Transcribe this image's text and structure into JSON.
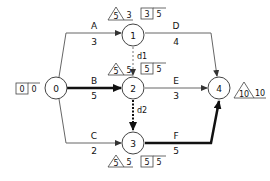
{
  "nodes": [
    {
      "id": "0",
      "label": "0"
    },
    {
      "id": "1",
      "label": "1"
    },
    {
      "id": "2",
      "label": "2"
    },
    {
      "id": "3",
      "label": "3"
    },
    {
      "id": "4",
      "label": "4"
    }
  ],
  "activities": [
    {
      "name": "A",
      "duration": "3",
      "from": "0",
      "to": "1",
      "critical": false
    },
    {
      "name": "B",
      "duration": "5",
      "from": "0",
      "to": "2",
      "critical": true
    },
    {
      "name": "C",
      "duration": "2",
      "from": "0",
      "to": "3",
      "critical": false
    },
    {
      "name": "D",
      "duration": "4",
      "from": "1",
      "to": "4",
      "critical": false
    },
    {
      "name": "E",
      "duration": "3",
      "from": "2",
      "to": "4",
      "critical": false
    },
    {
      "name": "F",
      "duration": "5",
      "from": "3",
      "to": "4",
      "critical": true
    }
  ],
  "dummies": [
    {
      "name": "d1",
      "from": "1",
      "to": "2"
    },
    {
      "name": "d2",
      "from": "2",
      "to": "3",
      "critical": true
    }
  ],
  "annotations": {
    "node0": {
      "box1": "0",
      "box2": "0"
    },
    "node1": {
      "tri": "5",
      "tri_val": "3",
      "box1": "3",
      "box2": "5"
    },
    "node2": {
      "tri": "5",
      "tri_val": "5",
      "box1": "5",
      "box2": "5"
    },
    "node3": {
      "tri": "5",
      "tri_val": "5",
      "box1": "5",
      "box2": "5"
    },
    "node4": {
      "tri": "10",
      "tri_val": "10"
    }
  },
  "colors": {
    "line": "#555555",
    "critical": "#111111"
  }
}
